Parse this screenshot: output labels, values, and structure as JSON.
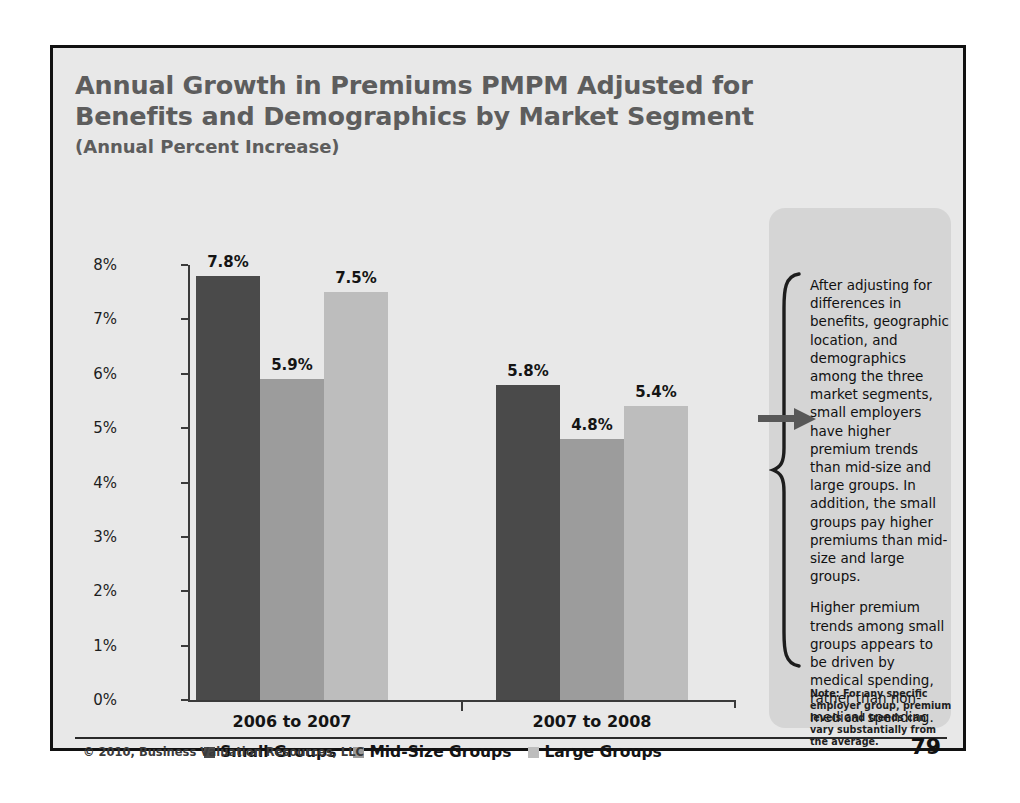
{
  "slide": {
    "title_line_1": "Annual Growth in Premiums PMPM Adjusted for",
    "title_line_2": "Benefits and Demographics by Market Segment",
    "subtitle": "(Annual Percent Increase)",
    "copyright": "© 2010, Business Valuation Resources, LLC",
    "page_number": "79"
  },
  "panel": {
    "paragraph_1": "After adjusting for differences in benefits, geographic location, and demographics among the three market segments, small employers have higher premium trends than mid-size and large groups. In addition, the small groups pay higher premiums than mid-size and large groups.",
    "paragraph_2": "Higher premium trends among small groups appears to be driven by medical spending, rather than non-medical spending.",
    "note": "Note: For any specific employer group, premium levels and trends can vary substantially from the average."
  },
  "colors": {
    "small_groups": "#4a4a4a",
    "mid_size_groups": "#9c9c9c",
    "large_groups": "#bdbdbd",
    "slide_background": "#e8e8e8",
    "title_text": "#5d5d5d",
    "axis": "#3a3a3a"
  },
  "chart_data": {
    "type": "bar",
    "title": "Annual Growth in Premiums PMPM Adjusted for Benefits and Demographics by Market Segment",
    "subtitle": "(Annual Percent Increase)",
    "xlabel": "",
    "ylabel": "",
    "categories": [
      "2006 to 2007",
      "2007 to 2008"
    ],
    "series": [
      {
        "name": "Small Groups",
        "values": [
          7.8,
          5.8
        ],
        "labels": [
          "7.8%",
          "5.8%"
        ],
        "color": "#4a4a4a"
      },
      {
        "name": "Mid-Size Groups",
        "values": [
          5.9,
          4.8
        ],
        "labels": [
          "5.9%",
          "4.8%"
        ],
        "color": "#9c9c9c"
      },
      {
        "name": "Large Groups",
        "values": [
          7.5,
          5.4
        ],
        "labels": [
          "7.5%",
          "5.4%"
        ],
        "color": "#bdbdbd"
      }
    ],
    "ylim": [
      0,
      8
    ],
    "ytick_labels": [
      "0%",
      "1%",
      "2%",
      "3%",
      "4%",
      "5%",
      "6%",
      "7%",
      "8%"
    ],
    "ytick_values": [
      0,
      1,
      2,
      3,
      4,
      5,
      6,
      7,
      8
    ],
    "grid": false,
    "legend_position": "bottom"
  }
}
